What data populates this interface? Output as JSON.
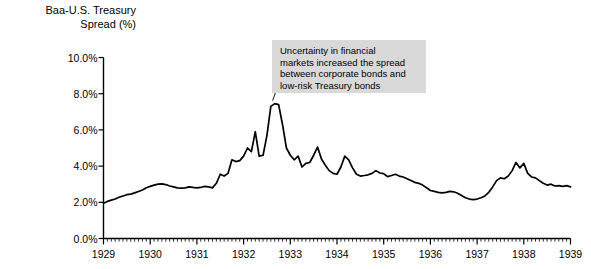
{
  "chart_data": {
    "type": "line",
    "title": "Baa-U.S. Treasury\nSpread (%)",
    "ylabel": "Baa-U.S. Treasury Spread (%)",
    "xlabel": "",
    "ylim": [
      0,
      10
    ],
    "xlim": [
      1929,
      1939
    ],
    "grid": false,
    "legend": "none",
    "ytick_labels": [
      "0.0%",
      "2.0%",
      "4.0%",
      "6.0%",
      "8.0%",
      "10.0%"
    ],
    "ytick_values": [
      0,
      2,
      4,
      6,
      8,
      10
    ],
    "xtick_labels": [
      "1929",
      "1930",
      "1931",
      "1932",
      "1933",
      "1934",
      "1935",
      "1936",
      "1937",
      "1938",
      "1939"
    ],
    "xtick_values": [
      1929,
      1930,
      1931,
      1932,
      1933,
      1934,
      1935,
      1936,
      1937,
      1938,
      1939
    ],
    "minor_ticks_per_year": 12,
    "line_color": "#000000",
    "series": [
      {
        "name": "Baa-U.S. Treasury Spread",
        "x": [
          1929.0,
          1929.083,
          1929.167,
          1929.25,
          1929.333,
          1929.417,
          1929.5,
          1929.583,
          1929.667,
          1929.75,
          1929.833,
          1929.917,
          1930.0,
          1930.083,
          1930.167,
          1930.25,
          1930.333,
          1930.417,
          1930.5,
          1930.583,
          1930.667,
          1930.75,
          1930.833,
          1930.917,
          1931.0,
          1931.083,
          1931.167,
          1931.25,
          1931.333,
          1931.417,
          1931.5,
          1931.583,
          1931.667,
          1931.75,
          1931.833,
          1931.917,
          1932.0,
          1932.083,
          1932.167,
          1932.25,
          1932.333,
          1932.417,
          1932.5,
          1932.583,
          1932.667,
          1932.75,
          1932.833,
          1932.917,
          1933.0,
          1933.083,
          1933.167,
          1933.25,
          1933.333,
          1933.417,
          1933.5,
          1933.583,
          1933.667,
          1933.75,
          1933.833,
          1933.917,
          1934.0,
          1934.083,
          1934.167,
          1934.25,
          1934.333,
          1934.417,
          1934.5,
          1934.583,
          1934.667,
          1934.75,
          1934.833,
          1934.917,
          1935.0,
          1935.083,
          1935.167,
          1935.25,
          1935.333,
          1935.417,
          1935.5,
          1935.583,
          1935.667,
          1935.75,
          1935.833,
          1935.917,
          1936.0,
          1936.083,
          1936.167,
          1936.25,
          1936.333,
          1936.417,
          1936.5,
          1936.583,
          1936.667,
          1936.75,
          1936.833,
          1936.917,
          1937.0,
          1937.083,
          1937.167,
          1937.25,
          1937.333,
          1937.417,
          1937.5,
          1937.583,
          1937.667,
          1937.75,
          1937.833,
          1937.917,
          1938.0,
          1938.083,
          1938.167,
          1938.25,
          1938.333,
          1938.417,
          1938.5,
          1938.583,
          1938.667,
          1938.75,
          1938.833,
          1938.917,
          1939.0
        ],
        "values": [
          1.95,
          2.05,
          2.12,
          2.18,
          2.28,
          2.35,
          2.42,
          2.45,
          2.52,
          2.6,
          2.68,
          2.8,
          2.88,
          2.95,
          3.0,
          3.02,
          2.98,
          2.9,
          2.85,
          2.8,
          2.78,
          2.8,
          2.85,
          2.82,
          2.8,
          2.82,
          2.88,
          2.85,
          2.8,
          3.05,
          3.55,
          3.45,
          3.6,
          4.35,
          4.25,
          4.3,
          4.55,
          5.0,
          4.8,
          5.9,
          4.55,
          4.6,
          5.7,
          7.3,
          7.45,
          7.4,
          6.3,
          5.0,
          4.6,
          4.35,
          4.55,
          3.95,
          4.15,
          4.2,
          4.6,
          5.05,
          4.4,
          4.05,
          3.75,
          3.6,
          3.55,
          3.95,
          4.55,
          4.35,
          3.9,
          3.55,
          3.45,
          3.48,
          3.52,
          3.6,
          3.75,
          3.62,
          3.58,
          3.42,
          3.48,
          3.55,
          3.45,
          3.4,
          3.3,
          3.2,
          3.1,
          3.05,
          2.95,
          2.8,
          2.65,
          2.6,
          2.55,
          2.52,
          2.55,
          2.6,
          2.58,
          2.5,
          2.38,
          2.25,
          2.18,
          2.15,
          2.18,
          2.25,
          2.35,
          2.55,
          2.85,
          3.2,
          3.35,
          3.3,
          3.45,
          3.75,
          4.2,
          3.9,
          4.15,
          3.6,
          3.4,
          3.35,
          3.2,
          3.05,
          2.95,
          3.0,
          2.9,
          2.92,
          2.88,
          2.92,
          2.85
        ]
      }
    ],
    "annotation": {
      "text": "Uncertainty in financial\nmarkets increased the spread\nbetween corporate bonds and\nlow-risk Treasury bonds",
      "background": "#d9d9d9",
      "points_to_year": 1932.62,
      "points_to_value": 7.45
    }
  }
}
